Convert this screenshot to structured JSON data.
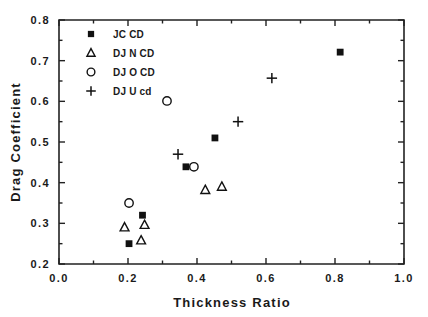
{
  "chart_data": {
    "type": "scatter",
    "title": "",
    "xlabel": "Thickness  Ratio",
    "ylabel": "Drag  Coefficient",
    "xlim": [
      0.0,
      1.0
    ],
    "ylim": [
      0.2,
      0.8
    ],
    "xticks": [
      "0.0",
      "0.2",
      "0.4",
      "0.6",
      "0.8",
      "1.0"
    ],
    "xtick_values": [
      0.0,
      0.2,
      0.4,
      0.6,
      0.8,
      1.0
    ],
    "yticks": [
      "0.2",
      "0.3",
      "0.4",
      "0.5",
      "0.6",
      "0.7",
      "0.8"
    ],
    "ytick_values": [
      0.2,
      0.3,
      0.4,
      0.5,
      0.6,
      0.7,
      0.8
    ],
    "grid": false,
    "legend_position": "upper-left-inside",
    "series": [
      {
        "name": "JC CD",
        "marker": "filled-square",
        "points": [
          {
            "x": 0.203,
            "y": 0.25
          },
          {
            "x": 0.242,
            "y": 0.32
          },
          {
            "x": 0.368,
            "y": 0.439
          },
          {
            "x": 0.452,
            "y": 0.51
          },
          {
            "x": 0.815,
            "y": 0.721
          }
        ]
      },
      {
        "name": "DJ N CD",
        "marker": "open-triangle",
        "points": [
          {
            "x": 0.19,
            "y": 0.29
          },
          {
            "x": 0.238,
            "y": 0.258
          },
          {
            "x": 0.248,
            "y": 0.296
          },
          {
            "x": 0.424,
            "y": 0.382
          },
          {
            "x": 0.472,
            "y": 0.39
          }
        ]
      },
      {
        "name": "DJ O CD",
        "marker": "open-circle",
        "points": [
          {
            "x": 0.203,
            "y": 0.35
          },
          {
            "x": 0.313,
            "y": 0.601
          },
          {
            "x": 0.391,
            "y": 0.439
          }
        ]
      },
      {
        "name": "DJ U cd",
        "marker": "plus",
        "points": [
          {
            "x": 0.345,
            "y": 0.47
          },
          {
            "x": 0.519,
            "y": 0.55
          },
          {
            "x": 0.617,
            "y": 0.657
          }
        ]
      }
    ],
    "legend_entries": [
      {
        "label": "JC CD",
        "marker": "filled-square"
      },
      {
        "label": "DJ N CD",
        "marker": "open-triangle"
      },
      {
        "label": "DJ O CD",
        "marker": "open-circle"
      },
      {
        "label": "DJ U cd",
        "marker": "plus"
      }
    ]
  },
  "colors": {
    "ink": "#111111",
    "axis": "#222222",
    "background": "#ffffff"
  }
}
